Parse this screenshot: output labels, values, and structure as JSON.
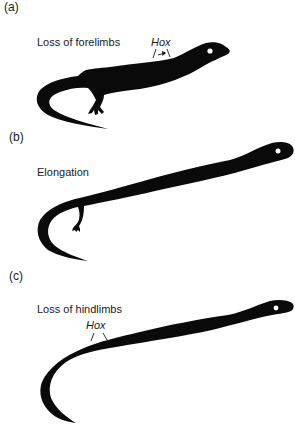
{
  "figure": {
    "panels": [
      {
        "id": "a",
        "label": "(a)",
        "caption": "Loss of forelimbs",
        "gene_label": "Hox",
        "gene_marker": "bracket-with-arrow"
      },
      {
        "id": "b",
        "label": "(b)",
        "caption": "Elongation"
      },
      {
        "id": "c",
        "label": "(c)",
        "caption": "Loss of hindlimbs",
        "gene_label": "Hox",
        "gene_marker": "bracket"
      }
    ],
    "colors": {
      "silhouette": "#0a0a0a",
      "background": "#ffffff",
      "text": "#1a1a1a"
    }
  }
}
